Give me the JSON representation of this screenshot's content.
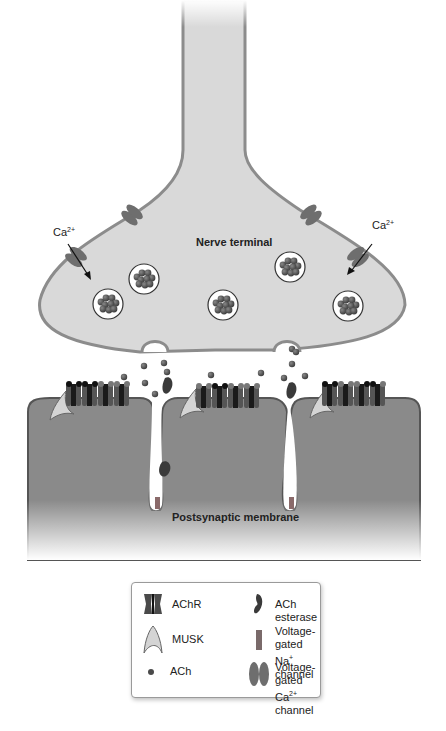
{
  "diagram": {
    "labels": {
      "nerve_terminal": "Nerve terminal",
      "postsynaptic_membrane": "Postsynaptic membrane",
      "ca_left_base": "Ca",
      "ca_left_sup": "2+",
      "ca_right_base": "Ca",
      "ca_right_sup": "2+"
    },
    "colors": {
      "terminal_fill": "#d9d9d9",
      "terminal_stroke": "#8c8c8c",
      "postsynaptic_fill": "#8a8a8a",
      "postsynaptic_stroke": "#555555",
      "channel": "#6e6e6e",
      "achr_dark": "#1a1a1a",
      "achr_mid": "#555555",
      "ach_dot": "#4a4a4a",
      "musk_fill": "#d4d4d4",
      "vesicle_fill": "#ffffff"
    }
  },
  "legend": {
    "items": [
      {
        "icon": "achr-icon",
        "label": "AChR"
      },
      {
        "icon": "ach-esterase-icon",
        "label": "ACh esterase"
      },
      {
        "icon": "musk-icon",
        "label": "MUSK"
      },
      {
        "icon": "na-channel-icon",
        "label_line1": "Voltage-gated",
        "label_line2_base": "Na",
        "label_line2_sup": "+",
        "label_line2_rest": " channel"
      },
      {
        "icon": "ach-icon",
        "label": "ACh"
      },
      {
        "icon": "ca-channel-icon",
        "label_line1": "Voltage-gated",
        "label_line2_base": "Ca",
        "label_line2_sup": "2+",
        "label_line2_rest": " channel"
      }
    ]
  }
}
